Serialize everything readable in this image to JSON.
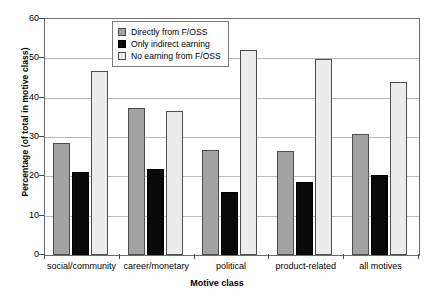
{
  "chart_data": {
    "type": "bar",
    "title": "",
    "xlabel": "Motive class",
    "ylabel": "Percentage (of total in motive class)",
    "categories": [
      "social/community",
      "career/monetary",
      "political",
      "product-related",
      "all motives"
    ],
    "series": [
      {
        "name": "Directly from F/OSS",
        "color": "#a3a3a3",
        "values": [
          28.5,
          37.5,
          26.8,
          26.4,
          30.8
        ]
      },
      {
        "name": "Only indirect earning",
        "color": "#0a0a0a",
        "values": [
          21.0,
          21.9,
          16.1,
          18.6,
          20.4
        ]
      },
      {
        "name": "No earning from F/OSS",
        "color": "#ececec",
        "values": [
          46.7,
          36.5,
          52.0,
          49.8,
          44.1
        ]
      }
    ],
    "ylim": [
      0,
      60
    ],
    "yticks": [
      0,
      10,
      20,
      30,
      40,
      50,
      60
    ],
    "ytick_labels": [
      "0",
      "10",
      "20",
      "30",
      "40",
      "50",
      "60"
    ],
    "grid": true,
    "legend_position": "top-center"
  }
}
